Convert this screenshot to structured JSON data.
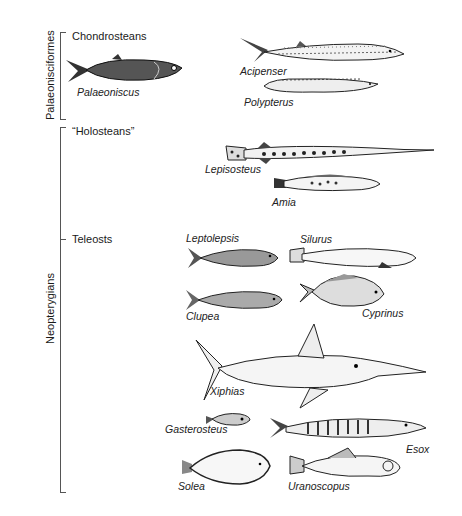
{
  "clades": {
    "palaeonisciformes": "Palaeonisciformes",
    "neopterygians": "Neopterygians"
  },
  "groups": {
    "chondrosteans": "Chondrosteans",
    "holosteans": "“Holosteans”",
    "teleosts": "Teleosts"
  },
  "fish": {
    "palaeoniscus": "Palaeoniscus",
    "acipenser": "Acipenser",
    "polypterus": "Polypterus",
    "lepisosteus": "Lepisosteus",
    "amia": "Amia",
    "leptolepsis": "Leptolepsis",
    "silurus": "Silurus",
    "clupea": "Clupea",
    "cyprinus": "Cyprinus",
    "xiphias": "Xiphias",
    "gasterosteus": "Gasterosteus",
    "esox": "Esox",
    "solea": "Solea",
    "uranoscopus": "Uranoscopus"
  }
}
